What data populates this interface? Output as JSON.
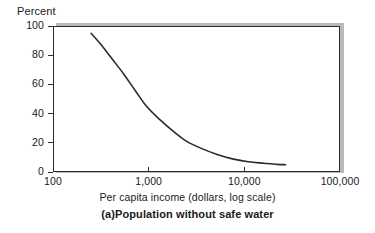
{
  "chart_data": {
    "type": "line",
    "title": "(a)Population without safe water",
    "xlabel": "Per capita income (dollars, log scale)",
    "ylabel": "Percent",
    "xscale": "log",
    "xlim": [
      100,
      100000
    ],
    "ylim": [
      0,
      100
    ],
    "grid": false,
    "legend": null,
    "xticks": [
      {
        "value": 100,
        "label": "100"
      },
      {
        "value": 1000,
        "label": "1,000"
      },
      {
        "value": 10000,
        "label": "10,000"
      },
      {
        "value": 100000,
        "label": "100,000"
      }
    ],
    "yticks": [
      {
        "value": 100,
        "label": "100"
      },
      {
        "value": 80,
        "label": "80"
      },
      {
        "value": 60,
        "label": "60"
      },
      {
        "value": 40,
        "label": "40"
      },
      {
        "value": 20,
        "label": "20"
      },
      {
        "value": 0,
        "label": "0"
      }
    ],
    "series": [
      {
        "name": "Population without safe water",
        "color": "#2b2b2b",
        "x": [
          250,
          320,
          420,
          550,
          720,
          950,
          1300,
          1800,
          2500,
          3600,
          5200,
          7500,
          11000,
          16000,
          22000,
          27000
        ],
        "values": [
          95,
          87,
          77,
          67,
          56,
          45,
          36,
          28,
          21,
          16,
          12,
          9,
          7,
          6,
          5.2,
          5
        ]
      }
    ]
  },
  "axis": {
    "y_title": "Percent"
  },
  "captions": {
    "x_title": "Per capita income (dollars, log scale)",
    "figure_label": "(a)Population without safe water"
  }
}
